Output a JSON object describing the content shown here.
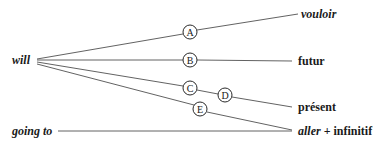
{
  "diagram": {
    "sources": [
      {
        "id": "will",
        "label": "will"
      },
      {
        "id": "going_to",
        "label": "going to"
      }
    ],
    "targets": {
      "vouloir": "vouloir",
      "futur": "futur",
      "present": "présent",
      "aller": "aller",
      "plus": "+",
      "infinitif": "infinitif"
    },
    "nodes": {
      "A": "A",
      "B": "B",
      "C": "C",
      "D": "D",
      "E": "E"
    },
    "edges": [
      {
        "from": "will",
        "via": [
          "A"
        ],
        "to": "vouloir"
      },
      {
        "from": "will",
        "via": [
          "B"
        ],
        "to": "futur"
      },
      {
        "from": "will",
        "via": [
          "C",
          "D"
        ],
        "to": "présent"
      },
      {
        "from": "will",
        "via": [
          "E"
        ],
        "to": "aller + infinitif"
      },
      {
        "from": "going to",
        "via": [],
        "to": "aller + infinitif"
      }
    ],
    "colors": {
      "line": "#3a3a3a",
      "text": "#1a1a1a",
      "background": "#ffffff"
    }
  }
}
